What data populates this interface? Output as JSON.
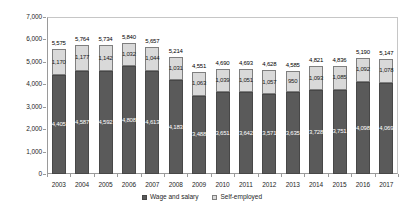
{
  "chart_data": {
    "type": "bar",
    "stacked": true,
    "title": "",
    "xlabel": "",
    "ylabel": "",
    "categories": [
      "2003",
      "2004",
      "2005",
      "2006",
      "2007",
      "2008",
      "2009",
      "2010",
      "2011",
      "2012",
      "2013",
      "2014",
      "2015",
      "2016",
      "2017"
    ],
    "series": [
      {
        "name": "Wage and salary",
        "color": "#5a5a5a",
        "border_color": "#474747",
        "label_color": "#ffffff",
        "values": [
          4405,
          4587,
          4592,
          4808,
          4613,
          4183,
          3488,
          3651,
          3642,
          3571,
          3635,
          3728,
          3751,
          4098,
          4069
        ]
      },
      {
        "name": "Self-employed",
        "color": "#d9d9d9",
        "border_color": "#7f7f7f",
        "label_color": "#1a1a1a",
        "values": [
          1170,
          1177,
          1142,
          1032,
          1044,
          1031,
          1063,
          1039,
          1051,
          1057,
          950,
          1093,
          1085,
          1092,
          1078
        ]
      }
    ],
    "totals": [
      5575,
      5764,
      5734,
      5840,
      5657,
      5214,
      4551,
      4690,
      4693,
      4628,
      4585,
      4821,
      4836,
      5190,
      5147
    ],
    "ylim": [
      0,
      7000
    ],
    "ytick_step": 1000,
    "ytick_labels": [
      "0",
      "1,000",
      "2,000",
      "3,000",
      "4,000",
      "5,000",
      "6,000",
      "7,000"
    ],
    "grid": false,
    "legend_position": "bottom",
    "data_labels": true
  }
}
